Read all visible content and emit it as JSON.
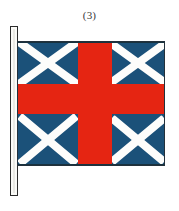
{
  "figure": {
    "caption": "(3)",
    "description_parts": {
      "flag_name": "flag",
      "pole_name": "flagpole"
    }
  },
  "flag": {
    "field_color": "#1b5179",
    "cross_color": "#e52512",
    "saltire_color": "#fdfdfb",
    "outline_color": "#23313b",
    "quadrants": [
      {
        "position": "top-left",
        "charge": "saltire"
      },
      {
        "position": "top-right",
        "charge": "saltire"
      },
      {
        "position": "bottom-left",
        "charge": "saltire"
      },
      {
        "position": "bottom-right",
        "charge": "saltire"
      }
    ]
  },
  "pole": {
    "fill_color": "#fbfbf8",
    "outline_color": "#2b2b2b"
  },
  "background": {
    "color": "#ffffff"
  }
}
